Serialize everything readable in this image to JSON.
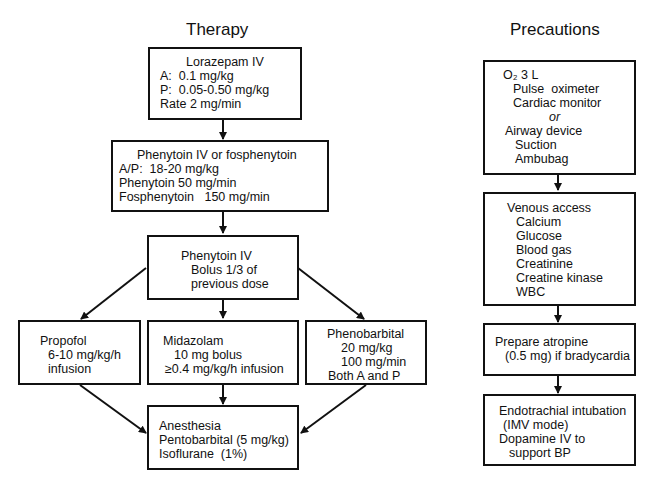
{
  "therapy": {
    "title": "Therapy",
    "boxes": [
      {
        "id": "lorazepam",
        "lines": [
          "Lorazepam IV",
          "A:  0.1 mg/kg",
          "P:  0.05-0.50 mg/kg",
          "Rate 2 mg/min"
        ]
      },
      {
        "id": "phenytoin-fos",
        "lines": [
          "Phenytoin IV or fosphenytoin",
          "A/P:  18-20 mg/kg",
          "Phenytoin 50 mg/min",
          "Fosphenytoin   150 mg/min"
        ]
      },
      {
        "id": "phenytoin-bolus",
        "lines": [
          "Phenytoin IV",
          "Bolus 1/3 of",
          "previous dose"
        ]
      },
      {
        "id": "propofol",
        "lines": [
          "Propofol",
          "6-10 mg/kg/h",
          "infusion"
        ]
      },
      {
        "id": "midazolam",
        "lines": [
          "Midazolam",
          "10 mg bolus",
          "≥0.4 mg/kg/h infusion"
        ]
      },
      {
        "id": "phenobarbital",
        "lines": [
          "Phenobarbital",
          "20 mg/kg",
          "100 mg/min",
          "Both A and P"
        ]
      },
      {
        "id": "anesthesia",
        "lines": [
          "Anesthesia",
          "Pentobarbital (5 mg/kg)",
          "Isoflurane  (1%)"
        ]
      }
    ]
  },
  "precautions": {
    "title": "Precautions",
    "boxes": [
      {
        "id": "oxygen",
        "lines": [
          "O₂ 3 L",
          "Pulse  oximeter",
          "Cardiac monitor",
          "or",
          "Airway device",
          "Suction",
          "Ambubag"
        ]
      },
      {
        "id": "venous",
        "lines": [
          "Venous access",
          "Calcium",
          "Glucose",
          "Blood gas",
          "Creatinine",
          "Creatine kinase",
          "WBC"
        ]
      },
      {
        "id": "atropine",
        "lines": [
          "Prepare atropine",
          "(0.5 mg) if bradycardia"
        ]
      },
      {
        "id": "intubation",
        "lines": [
          "Endotrachial intubation",
          "(IMV mode)",
          "Dopamine IV to",
          "support BP"
        ]
      }
    ]
  }
}
